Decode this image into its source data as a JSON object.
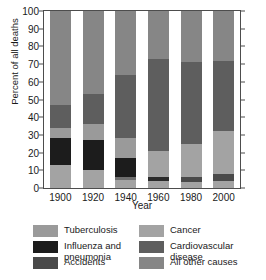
{
  "chart_data": {
    "type": "bar",
    "subtype": "stacked-bar",
    "title": "",
    "xlabel": "Year",
    "ylabel": "Percent of all deaths",
    "categories": [
      "1900",
      "1920",
      "1940",
      "1960",
      "1980",
      "2000"
    ],
    "ylim": [
      0,
      100
    ],
    "yticks": [
      0,
      10,
      20,
      30,
      40,
      50,
      60,
      70,
      80,
      90,
      100
    ],
    "ytick_labels": [
      "0",
      "10",
      "20",
      "30",
      "40",
      "50",
      "60",
      "70",
      "80",
      "90",
      "100"
    ],
    "grid": false,
    "legend_position": "bottom",
    "stack_order_bottom_to_top": [
      "All other causes",
      "Accidents",
      "Influenza and pneumonia",
      "Tuberculosis",
      "Cancer",
      "Cardiovascular disease",
      "All other causes (top)"
    ],
    "series": [
      {
        "name": "All other causes",
        "color": "#a3a3a3",
        "values": [
          13,
          10,
          4.5,
          4,
          3.5,
          4
        ]
      },
      {
        "name": "Accidents",
        "color": "#6e6e6e",
        "values": [
          0,
          0,
          1.5,
          2,
          2.5,
          4
        ]
      },
      {
        "name": "Influenza and pneumonia",
        "color": "#1c1c1c",
        "values": [
          15,
          17,
          11,
          0,
          0,
          0
        ]
      },
      {
        "name": "Tuberculosis",
        "color": "#9a9a9a",
        "values": [
          6,
          9,
          11,
          0,
          0,
          0
        ]
      },
      {
        "name": "Cancer",
        "color": "#a3a3a3",
        "values": [
          0,
          0,
          0,
          15,
          19,
          24
        ]
      },
      {
        "name": "Cardiovascular disease",
        "color": "#5e5e5e",
        "values": [
          13,
          17,
          36,
          52,
          46,
          40
        ]
      },
      {
        "name": "All other causes (top)",
        "color": "#868686",
        "values": [
          53,
          47,
          36,
          27,
          29,
          28
        ]
      }
    ],
    "bars": [
      {
        "year": "1900",
        "segments": [
          {
            "label": "All other causes",
            "from": 0,
            "to": 13,
            "color": "#a3a3a3"
          },
          {
            "label": "Influenza and pneumonia",
            "from": 13,
            "to": 28,
            "color": "#1c1c1c"
          },
          {
            "label": "Tuberculosis",
            "from": 28,
            "to": 34,
            "color": "#9a9a9a"
          },
          {
            "label": "Cardiovascular disease",
            "from": 34,
            "to": 47,
            "color": "#5e5e5e"
          },
          {
            "label": "All other causes",
            "from": 47,
            "to": 100,
            "color": "#868686"
          }
        ]
      },
      {
        "year": "1920",
        "segments": [
          {
            "label": "All other causes",
            "from": 0,
            "to": 10,
            "color": "#a3a3a3"
          },
          {
            "label": "Influenza and pneumonia",
            "from": 10,
            "to": 27,
            "color": "#1c1c1c"
          },
          {
            "label": "Tuberculosis",
            "from": 27,
            "to": 36,
            "color": "#9a9a9a"
          },
          {
            "label": "Cardiovascular disease",
            "from": 36,
            "to": 53,
            "color": "#5e5e5e"
          },
          {
            "label": "All other causes",
            "from": 53,
            "to": 100,
            "color": "#868686"
          }
        ]
      },
      {
        "year": "1940",
        "segments": [
          {
            "label": "All other causes",
            "from": 0,
            "to": 4.5,
            "color": "#a3a3a3"
          },
          {
            "label": "Accidents",
            "from": 4.5,
            "to": 6,
            "color": "#6e6e6e"
          },
          {
            "label": "Influenza and pneumonia",
            "from": 6,
            "to": 17,
            "color": "#1c1c1c"
          },
          {
            "label": "Tuberculosis",
            "from": 17,
            "to": 28,
            "color": "#9a9a9a"
          },
          {
            "label": "Cardiovascular disease",
            "from": 28,
            "to": 64,
            "color": "#5e5e5e"
          },
          {
            "label": "All other causes",
            "from": 64,
            "to": 100,
            "color": "#868686"
          }
        ]
      },
      {
        "year": "1960",
        "segments": [
          {
            "label": "All other causes",
            "from": 0,
            "to": 4,
            "color": "#a3a3a3"
          },
          {
            "label": "Accidents",
            "from": 4,
            "to": 6,
            "color": "#2b2b2b"
          },
          {
            "label": "Cancer",
            "from": 6,
            "to": 21,
            "color": "#a3a3a3"
          },
          {
            "label": "Cardiovascular disease",
            "from": 21,
            "to": 73,
            "color": "#5e5e5e"
          },
          {
            "label": "All other causes",
            "from": 73,
            "to": 100,
            "color": "#868686"
          }
        ]
      },
      {
        "year": "1980",
        "segments": [
          {
            "label": "All other causes",
            "from": 0,
            "to": 3.5,
            "color": "#a3a3a3"
          },
          {
            "label": "Accidents",
            "from": 3.5,
            "to": 6,
            "color": "#4a4a4a"
          },
          {
            "label": "Cancer",
            "from": 6,
            "to": 25,
            "color": "#a3a3a3"
          },
          {
            "label": "Cardiovascular disease",
            "from": 25,
            "to": 71,
            "color": "#5e5e5e"
          },
          {
            "label": "All other causes",
            "from": 71,
            "to": 100,
            "color": "#868686"
          }
        ]
      },
      {
        "year": "2000",
        "segments": [
          {
            "label": "All other causes",
            "from": 0,
            "to": 4,
            "color": "#a3a3a3"
          },
          {
            "label": "Accidents",
            "from": 4,
            "to": 8,
            "color": "#4a4a4a"
          },
          {
            "label": "Cancer",
            "from": 8,
            "to": 32,
            "color": "#a3a3a3"
          },
          {
            "label": "Cardiovascular disease",
            "from": 32,
            "to": 72,
            "color": "#5e5e5e"
          },
          {
            "label": "All other causes",
            "from": 72,
            "to": 100,
            "color": "#868686"
          }
        ]
      }
    ],
    "legend": [
      {
        "label": "Tuberculosis",
        "color": "#9a9a9a"
      },
      {
        "label": "Cancer",
        "color": "#a3a3a3"
      },
      {
        "label": "Influenza and pneumonia",
        "color": "#1c1c1c"
      },
      {
        "label": "Cardiovascular disease",
        "color": "#5e5e5e"
      },
      {
        "label": "Accidents",
        "color": "#4a4a4a"
      },
      {
        "label": "All other causes",
        "color": "#868686"
      }
    ]
  }
}
